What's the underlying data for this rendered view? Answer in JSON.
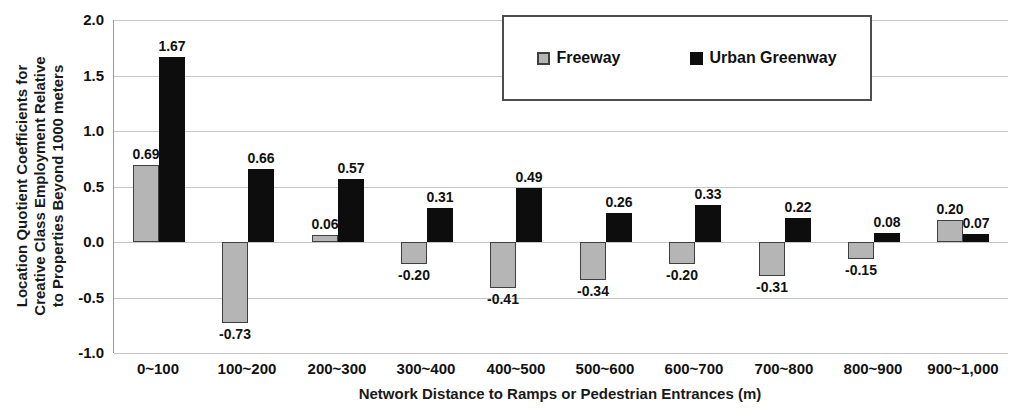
{
  "chart_data": {
    "type": "bar",
    "title": "",
    "categories": [
      "0~100",
      "100~200",
      "200~300",
      "300~400",
      "400~500",
      "500~600",
      "600~700",
      "700~800",
      "800~900",
      "900~1,000"
    ],
    "series": [
      {
        "name": "Freeway",
        "color": "#b5b5b5",
        "border_color": "#3f3f3f",
        "values": [
          0.69,
          -0.73,
          0.06,
          -0.2,
          -0.41,
          -0.34,
          -0.2,
          -0.31,
          -0.15,
          0.2
        ]
      },
      {
        "name": "Urban Greenway",
        "color": "#0d0d0d",
        "border_color": "#0d0d0d",
        "values": [
          1.67,
          0.66,
          0.57,
          0.31,
          0.49,
          0.26,
          0.33,
          0.22,
          0.08,
          0.07
        ]
      }
    ],
    "xlabel": "Network Distance to Ramps or Pedestrian Entrances (m)",
    "ylabel_lines": [
      "Location Quotient Coefficients for",
      "Creative Class Employment Relative",
      "to Properties Beyond 1000 meters"
    ],
    "ylim": [
      -1.0,
      2.0
    ],
    "ytick_labels": [
      "2.0",
      "1.5",
      "1.0",
      "0.5",
      "0.0",
      "-0.5",
      "-1.0"
    ],
    "ytick_values": [
      2.0,
      1.5,
      1.0,
      0.5,
      0.0,
      -0.5,
      -1.0
    ],
    "grid": true,
    "legend_position": "top-center",
    "value_label_decimals": 2
  },
  "colors": {
    "background": "#ffffff",
    "gridline": "#c6c6c6",
    "axis_line": "#9a9a9a",
    "text": "#111111",
    "legend_border": "#4d4d4d"
  }
}
